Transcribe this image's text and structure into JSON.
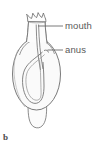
{
  "figure": {
    "caption": "b",
    "line_color": "#6b6b6b",
    "fill_color": "#fafafa",
    "label_color": "#5a5a5a",
    "background": "#ffffff"
  },
  "labels": [
    {
      "id": "mouth",
      "text": "mouth",
      "leader_from_x": 63,
      "leader_to_x": 38,
      "leader_y": 26
    },
    {
      "id": "anus",
      "text": "anus",
      "leader_from_x": 63,
      "leader_to_x": 47,
      "leader_y": 50
    }
  ],
  "parts": {
    "tentacle_crown": "tentacle-crown",
    "neck": "neck",
    "body": "body-oval",
    "gut": "u-shaped-gut",
    "stalk": "stalk-peduncle"
  }
}
